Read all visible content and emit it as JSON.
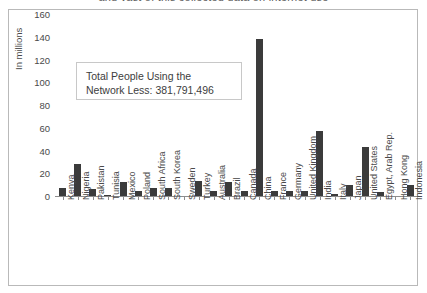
{
  "page": {
    "top_heading_partial": "and vast of this collected data on internet use"
  },
  "callout": {
    "line1": "Total People Using the",
    "line2": "Network Less: 381,791,496"
  },
  "chart_data": {
    "type": "bar",
    "title": "",
    "xlabel": "",
    "ylabel": "In millions",
    "ylim": [
      0,
      160
    ],
    "yticks": [
      160,
      140,
      120,
      100,
      80,
      60,
      40,
      20,
      0
    ],
    "grid": false,
    "legend": "none",
    "bar_color": "#3b3b3b",
    "axis_color": "#8d8d8d",
    "text_color": "#4a4a4a",
    "categories": [
      "Kenya",
      "Nigeria",
      "Pakistan",
      "Tunisia",
      "Mexico",
      "Poland",
      "South Africa",
      "South Korea",
      "Sweden",
      "Turkey",
      "Australia",
      "Brazil",
      "Canada",
      "China",
      "France",
      "Germany",
      "United Kingdom",
      "India",
      "Italy",
      "Japan",
      "United States",
      "Egypt, Arab Rep.",
      "Hong Kong",
      "Indonesia"
    ],
    "values": [
      8,
      29,
      7,
      2,
      13,
      5,
      8,
      8,
      1,
      14,
      5,
      13,
      5,
      139,
      5,
      5,
      5,
      58,
      3,
      11,
      44,
      4,
      1,
      11
    ]
  }
}
